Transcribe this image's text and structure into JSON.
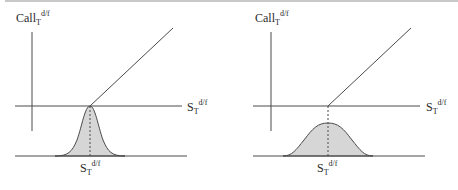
{
  "figure": {
    "colors": {
      "line": "#4a4a4a",
      "fill": "#d6d6d6",
      "rule": "#c8c8c8"
    },
    "panels": [
      {
        "id": "left",
        "description": "Call payoff with narrow (low-volatility) distribution of spot rate at expiry",
        "y_axis_label": {
          "main": "Call",
          "sub": "T",
          "sup": "d/f"
        },
        "x_axis_label": {
          "main": "S",
          "sub": "T",
          "sup": "d/f"
        },
        "strike_label": {
          "main": "S",
          "sub": "T",
          "sup": "d/f"
        },
        "distribution": "narrow"
      },
      {
        "id": "right",
        "description": "Call payoff with wide (high-volatility) distribution of spot rate at expiry",
        "y_axis_label": {
          "main": "Call",
          "sub": "T",
          "sup": "d/f"
        },
        "x_axis_label": {
          "main": "S",
          "sub": "T",
          "sup": "d/f"
        },
        "strike_label": {
          "main": "S",
          "sub": "T",
          "sup": "d/f"
        },
        "distribution": "wide"
      }
    ]
  }
}
